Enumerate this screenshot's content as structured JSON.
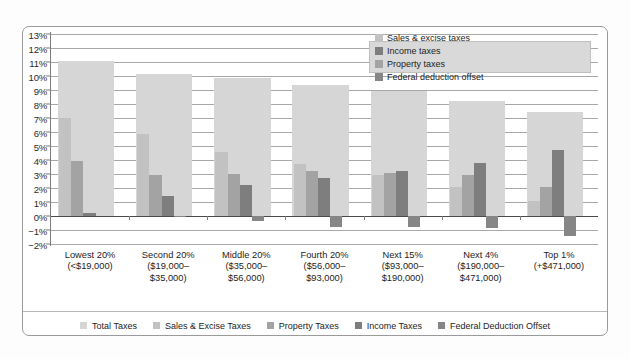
{
  "chart_data": {
    "type": "bar",
    "title": "",
    "subtitle": "",
    "xlabel": "",
    "ylabel": "",
    "ylim": [
      -2,
      13
    ],
    "ytick_labels": [
      "13%",
      "12%",
      "11%",
      "10%",
      "9%",
      "8%",
      "7%",
      "6%",
      "5%",
      "4%",
      "3%",
      "2%",
      "1%",
      "0%",
      "−1%",
      "−2%"
    ],
    "ytick_values": [
      13,
      12,
      11,
      10,
      9,
      8,
      7,
      6,
      5,
      4,
      3,
      2,
      1,
      0,
      -1,
      -2
    ],
    "grid": true,
    "legend_position": "inside-top-right and below-axis",
    "categories": [
      "Lowest 20%",
      "Second 20%",
      "Middle 20%",
      "Fourth 20%",
      "Next 15%",
      "Next 4%",
      "Top 1%"
    ],
    "category_sublabels": [
      [
        "(<$19,000)"
      ],
      [
        "($19,000–",
        "$35,000)"
      ],
      [
        "($35,000–",
        "$56,000)"
      ],
      [
        "($56,000–",
        "$93,000)"
      ],
      [
        "($93,000–",
        "$190,000)"
      ],
      [
        "($190,000–",
        "$471,000)"
      ],
      [
        "(+$471,000)"
      ]
    ],
    "series": [
      {
        "name": "Total Taxes",
        "key": "total",
        "color": "#d6d6d6",
        "values": [
          11.05,
          10.15,
          9.85,
          9.35,
          8.95,
          8.25,
          7.45
        ]
      },
      {
        "name": "Sales & Excise Taxes",
        "key": "sales",
        "color": "#c2c2c2",
        "values": [
          7.0,
          5.85,
          4.6,
          3.75,
          2.95,
          2.05,
          1.05
        ]
      },
      {
        "name": "Property Taxes",
        "key": "prop",
        "color": "#a3a3a3",
        "values": [
          3.9,
          2.95,
          3.0,
          3.25,
          3.1,
          2.95,
          2.1
        ]
      },
      {
        "name": "Income Taxes",
        "key": "inc",
        "color": "#7e7e7e",
        "values": [
          0.2,
          1.4,
          2.25,
          2.75,
          3.25,
          3.8,
          4.75
        ]
      },
      {
        "name": "Federal Deduction Offset",
        "key": "fed",
        "color": "#868686",
        "values": [
          0.0,
          -0.1,
          -0.35,
          -0.75,
          -0.8,
          -0.85,
          -1.45
        ]
      }
    ]
  },
  "inner_legend": {
    "items": [
      {
        "label": "Sales & excise taxes",
        "color": "#c2c2c2"
      },
      {
        "label": "Income taxes",
        "color": "#7e7e7e"
      },
      {
        "label": "Property taxes",
        "color": "#a3a3a3"
      },
      {
        "label": "Federal deduction offset",
        "color": "#868686"
      }
    ]
  },
  "bottom_legend": {
    "items": [
      {
        "label": "Total Taxes",
        "color": "#d6d6d6"
      },
      {
        "label": "Sales & Excise Taxes",
        "color": "#c2c2c2"
      },
      {
        "label": "Property Taxes",
        "color": "#a3a3a3"
      },
      {
        "label": "Income Taxes",
        "color": "#7e7e7e"
      },
      {
        "label": "Federal Deduction Offset",
        "color": "#868686"
      }
    ]
  }
}
